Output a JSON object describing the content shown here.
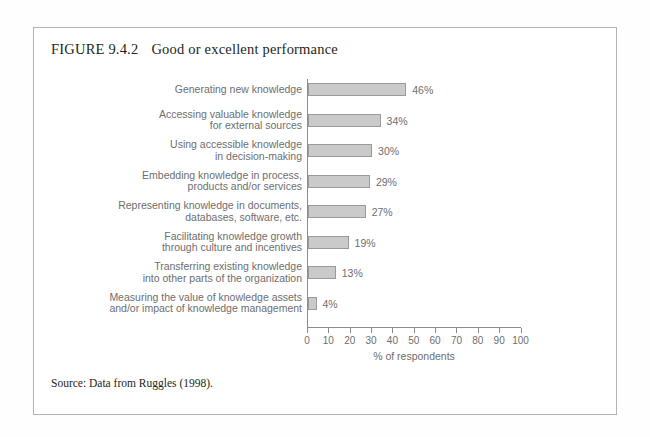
{
  "figure": {
    "number": "FIGURE 9.4.2",
    "title": "Good or excellent performance",
    "source": "Source: Data from Ruggles (1998)."
  },
  "chart_data": {
    "type": "bar",
    "orientation": "horizontal",
    "title": "Good or excellent performance",
    "xlabel": "% of respondents",
    "ylabel": "",
    "xlim": [
      0,
      100
    ],
    "xticks": [
      0,
      10,
      20,
      30,
      40,
      50,
      60,
      70,
      80,
      90,
      100
    ],
    "xticklabels": [
      "0",
      "10",
      "20",
      "30",
      "40",
      "50",
      "60",
      "70",
      "80",
      "90",
      "100"
    ],
    "grid": false,
    "legend": false,
    "bar_fill_color": "#cacaca",
    "bar_edge_color": "#9a9a9a",
    "categories": [
      "Generating new knowledge",
      "Accessing valuable knowledge for external sources",
      "Using accessible knowledge in decision-making",
      "Embedding knowledge in process, products and/or services",
      "Representing knowledge in documents, databases, software, etc.",
      "Facilitating knowledge growth through culture and incentives",
      "Transferring existing knowledge into other parts of the organization",
      "Measuring the value of knowledge assets and/or impact of knowledge management"
    ],
    "category_lines": [
      [
        "Generating new knowledge"
      ],
      [
        "Accessing valuable knowledge",
        "for external sources"
      ],
      [
        "Using accessible knowledge",
        "in decision-making"
      ],
      [
        "Embedding knowledge in process,",
        "products and/or services"
      ],
      [
        "Representing knowledge in documents,",
        "databases, software, etc."
      ],
      [
        "Facilitating knowledge growth",
        "through culture and incentives"
      ],
      [
        "Transferring existing knowledge",
        "into other parts of the organization"
      ],
      [
        "Measuring the value of knowledge assets",
        "and/or impact of knowledge management"
      ]
    ],
    "values": [
      46,
      34,
      30,
      29,
      27,
      19,
      13,
      4
    ],
    "value_labels": [
      "46%",
      "34%",
      "30%",
      "29%",
      "27%",
      "19%",
      "13%",
      "4%"
    ]
  }
}
